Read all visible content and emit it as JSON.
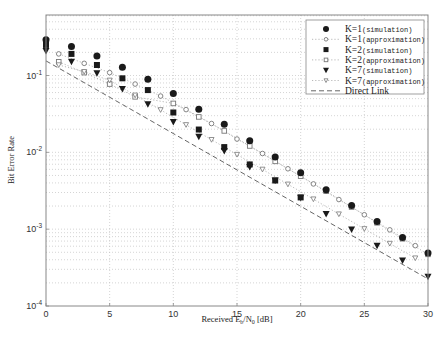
{
  "chart_data": {
    "type": "scatter",
    "title": "",
    "xlabel": "Received E_b/N_0 [dB]",
    "xlabel_parts": {
      "main": "Received E",
      "sub1": "b",
      "slash": "/N",
      "sub2": "0",
      "tail": " [dB]"
    },
    "ylabel": "Bit Error Rate",
    "xlim": [
      0,
      30
    ],
    "ylim": [
      0.0001,
      0.6
    ],
    "yscale": "log",
    "grid": true,
    "legend_position": "upper right",
    "x_ticks": [
      0,
      5,
      10,
      15,
      20,
      25,
      30
    ],
    "x_tick_labels": [
      "0",
      "5",
      "10",
      "15",
      "20",
      "25",
      "30"
    ],
    "y_ticks": [
      0.1,
      0.01,
      0.001,
      0.0001
    ],
    "y_tick_labels": [
      {
        "base": "10",
        "exp": "-1"
      },
      {
        "base": "10",
        "exp": "-2"
      },
      {
        "base": "10",
        "exp": "-3"
      },
      {
        "base": "10",
        "exp": "-4"
      }
    ],
    "series": [
      {
        "name": "K=1",
        "tag": "(simulation)",
        "marker": "filled-circle",
        "line": "none",
        "x": [
          0,
          2,
          4,
          6,
          8,
          10,
          12,
          14,
          16,
          18,
          20,
          22,
          24,
          26,
          28,
          30
        ],
        "values": [
          0.291,
          0.238,
          0.18,
          0.128,
          0.0892,
          0.0585,
          0.0365,
          0.0232,
          0.0141,
          0.00869,
          0.00543,
          0.00325,
          0.00203,
          0.00126,
          0.000781,
          0.000489
        ]
      },
      {
        "name": "K=1",
        "tag": "(approximation)",
        "marker": "open-circle",
        "line": "dotted",
        "x": [
          1,
          3,
          5,
          7,
          9,
          11,
          13,
          15,
          17,
          19,
          21,
          23,
          25,
          27,
          29
        ],
        "values": [
          0.191,
          0.144,
          0.109,
          0.0774,
          0.054,
          0.036,
          0.0237,
          0.0149,
          0.00966,
          0.00611,
          0.00388,
          0.00243,
          0.00154,
          0.00098,
          0.00061
        ]
      },
      {
        "name": "K=2",
        "tag": "(simulation)",
        "marker": "filled-square",
        "line": "none",
        "x": [
          0,
          2,
          4,
          6,
          8,
          10,
          12,
          14,
          16,
          18,
          20
        ],
        "values": [
          0.25,
          0.191,
          0.137,
          0.0919,
          0.0646,
          0.033,
          0.0198,
          0.0117,
          0.00696,
          0.0043,
          0.00259
        ]
      },
      {
        "name": "K=2",
        "tag": "(approximation)",
        "marker": "open-square",
        "line": "dotted",
        "x": [
          1,
          3,
          5,
          7,
          10,
          12,
          14,
          16,
          18,
          20,
          22,
          24,
          26,
          28,
          30
        ],
        "values": [
          0.151,
          0.109,
          0.0774,
          0.0528,
          0.0433,
          0.0289,
          0.019,
          0.0121,
          0.00763,
          0.0049,
          0.00312,
          0.00194,
          0.00121,
          0.00075,
          0.00047
        ]
      },
      {
        "name": "K=7",
        "tag": "(simulation)",
        "marker": "filled-triangle-down",
        "line": "none",
        "x": [
          0,
          2,
          4,
          6,
          8,
          10,
          12,
          14,
          16,
          18,
          20,
          22,
          24,
          26,
          28,
          30
        ],
        "values": [
          0.209,
          0.151,
          0.107,
          0.0666,
          0.0424,
          0.0249,
          0.0159,
          0.0104,
          0.00642,
          0.0043,
          0.00256,
          0.00158,
          0.00099,
          0.00061,
          0.00039,
          0.00024
        ]
      },
      {
        "name": "K=7",
        "tag": "(approximation)",
        "marker": "open-triangle-down",
        "line": "dotted",
        "x": [
          1,
          3,
          5,
          7,
          9,
          11,
          13,
          15,
          17,
          19,
          21,
          23,
          25,
          27,
          29
        ],
        "values": [
          0.137,
          0.112,
          0.0865,
          0.0553,
          0.0357,
          0.0228,
          0.0146,
          0.00935,
          0.006,
          0.00384,
          0.00246,
          0.00157,
          0.00101,
          0.00065,
          0.00042
        ]
      },
      {
        "name": "Direct Link",
        "tag": "",
        "marker": "none",
        "line": "dashed",
        "x": [
          0,
          30
        ],
        "values": [
          0.155,
          0.000225
        ]
      }
    ]
  },
  "legend": {
    "items": [
      {
        "main": "K=1",
        "tag": "(simulation)",
        "marker": "filled-circle",
        "line": "none"
      },
      {
        "main": "K=1",
        "tag": "(approximation)",
        "marker": "open-circle",
        "line": "dotted"
      },
      {
        "main": "K=2",
        "tag": "(simulation)",
        "marker": "filled-square",
        "line": "none"
      },
      {
        "main": "K=2",
        "tag": "(approximation)",
        "marker": "open-square",
        "line": "dotted"
      },
      {
        "main": "K=7",
        "tag": "(simulation)",
        "marker": "filled-triangle-down",
        "line": "none"
      },
      {
        "main": "K=7",
        "tag": "(approximation)",
        "marker": "open-triangle-down",
        "line": "dotted"
      },
      {
        "main": "Direct Link",
        "tag": "",
        "marker": "none",
        "line": "dashed"
      }
    ]
  },
  "colors": {
    "marker": "#1a1a1a",
    "open_marker": "#777777",
    "grid": "#b8b8b8",
    "axis": "#888888",
    "direct_link": "#555555"
  }
}
